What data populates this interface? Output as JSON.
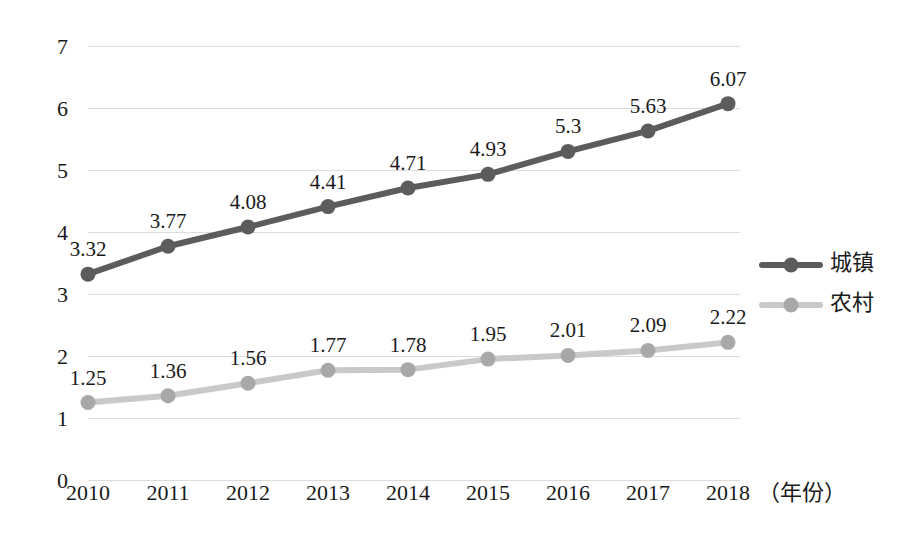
{
  "chart_data": {
    "type": "line",
    "title": "",
    "subtitle": "",
    "xlabel": "（年份）",
    "ylabel": "",
    "categories": [
      "2010",
      "2011",
      "2012",
      "2013",
      "2014",
      "2015",
      "2016",
      "2017",
      "2018"
    ],
    "series": [
      {
        "name": "城镇",
        "color": "#5c5c5c",
        "values": [
          3.32,
          3.77,
          4.08,
          4.41,
          4.71,
          4.93,
          5.3,
          5.63,
          6.07
        ],
        "labels": [
          "3.32",
          "3.77",
          "4.08",
          "4.41",
          "4.71",
          "4.93",
          "5.3",
          "5.63",
          "6.07"
        ]
      },
      {
        "name": "农村",
        "color": "#c9c9c9",
        "values": [
          1.25,
          1.36,
          1.56,
          1.77,
          1.78,
          1.95,
          2.01,
          2.09,
          2.22
        ],
        "labels": [
          "1.25",
          "1.36",
          "1.56",
          "1.77",
          "1.78",
          "1.95",
          "2.01",
          "2.09",
          "2.22"
        ]
      }
    ],
    "ylim": [
      0,
      7
    ],
    "yticks": [
      "0",
      "1",
      "2",
      "3",
      "4",
      "5",
      "6",
      "7"
    ],
    "grid": true,
    "legend_position": "right",
    "marker": "circle",
    "data_labels": true
  },
  "legend": {
    "items": [
      {
        "label": "城镇",
        "color": "#5c5c5c",
        "marker_color": "#5c5c5c"
      },
      {
        "label": "农村",
        "color": "#c9c9c9",
        "marker_color": "#a8a8a8"
      }
    ]
  },
  "axis": {
    "x_title": "（年份）",
    "y_max_label": "7",
    "y_min_label": "0"
  }
}
